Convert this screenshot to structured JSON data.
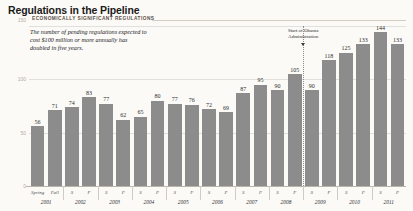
{
  "header": {
    "title": "Regulations in the Pipeline",
    "axis_top_label": "150",
    "kicker": "ECONOMICALLY SIGNIFICANT REGULATIONS",
    "blurb_lines": [
      "The number of pending regulations expected to",
      "cost $100 million or more annually has",
      "doubled in five years."
    ]
  },
  "chart_data": {
    "type": "bar",
    "title": "Economically Significant Regulations",
    "xlabel": "",
    "ylabel": "",
    "ylim": [
      0,
      150
    ],
    "yticks": [
      "0",
      "50",
      "100",
      "150"
    ],
    "ytick_values": [
      0,
      50,
      100,
      150
    ],
    "grid": true,
    "legend": "none",
    "bar_color": "#8c8c8c",
    "categories": [
      "Spring 2001",
      "Fall 2001",
      "S 2002",
      "F 2002",
      "S 2003",
      "F 2003",
      "S 2004",
      "F 2004",
      "S 2005",
      "F 2005",
      "S 2006",
      "F 2006",
      "S 2007",
      "F 2007",
      "S 2008",
      "F 2008",
      "S 2009",
      "F 2009",
      "S 2010",
      "F 2010",
      "S 2011",
      "F 2011"
    ],
    "season_labels": [
      "Spring",
      "Fall",
      "S",
      "F",
      "S",
      "F",
      "S",
      "F",
      "S",
      "F",
      "S",
      "F",
      "S",
      "F",
      "S",
      "F",
      "S",
      "F",
      "S",
      "F",
      "S",
      "F"
    ],
    "year_groups": [
      {
        "year": "2001",
        "count": 2
      },
      {
        "year": "2002",
        "count": 2
      },
      {
        "year": "2003",
        "count": 2
      },
      {
        "year": "2004",
        "count": 2
      },
      {
        "year": "2005",
        "count": 2
      },
      {
        "year": "2006",
        "count": 2
      },
      {
        "year": "2007",
        "count": 2
      },
      {
        "year": "2008",
        "count": 2
      },
      {
        "year": "2009",
        "count": 2
      },
      {
        "year": "2010",
        "count": 2
      },
      {
        "year": "2011",
        "count": 2
      }
    ],
    "values": [
      56,
      71,
      74,
      83,
      77,
      62,
      65,
      80,
      77,
      76,
      72,
      69,
      87,
      95,
      90,
      105,
      90,
      118,
      125,
      133,
      144,
      133
    ],
    "annotations": [
      {
        "id": "obama-marker",
        "text_lines": [
          "Start of Obama",
          "Administration"
        ],
        "at_index": 16,
        "marker": "dotted-vertical-line-with-down-arrow"
      }
    ]
  }
}
